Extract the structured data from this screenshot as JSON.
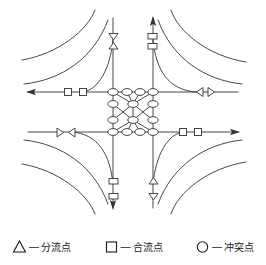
{
  "figure": {
    "type": "traffic-interchange-conflict-point-diagram"
  },
  "legend": {
    "items": [
      {
        "symbol": "triangle",
        "icon_name": "triangle-icon",
        "dash": "—",
        "label": "分流点"
      },
      {
        "symbol": "square",
        "icon_name": "square-icon",
        "dash": "—",
        "label": "合流点"
      },
      {
        "symbol": "circle",
        "icon_name": "circle-icon",
        "dash": "—",
        "label": "冲突点"
      }
    ]
  },
  "colors": {
    "stroke": "#333333",
    "fill": "#ffffff",
    "text": "#1a1a1a",
    "background": "#ffffff"
  },
  "geometry": {
    "center_x": 133,
    "center_y": 112,
    "road_north_left_x": 113,
    "road_north_right_x": 153,
    "road_west_top_y": 92,
    "road_east_bottom_y": 132
  },
  "arrows": {
    "north_up": "up",
    "south_down": "down",
    "west_left": "left",
    "east_right": "right"
  },
  "conflict_points": [
    {
      "x": 113,
      "y": 92
    },
    {
      "x": 127,
      "y": 92
    },
    {
      "x": 140,
      "y": 92
    },
    {
      "x": 153,
      "y": 92
    },
    {
      "x": 133,
      "y": 104
    },
    {
      "x": 113,
      "y": 104
    },
    {
      "x": 153,
      "y": 104
    },
    {
      "x": 113,
      "y": 120
    },
    {
      "x": 153,
      "y": 120
    },
    {
      "x": 133,
      "y": 120
    },
    {
      "x": 113,
      "y": 132
    },
    {
      "x": 127,
      "y": 132
    },
    {
      "x": 140,
      "y": 132
    },
    {
      "x": 153,
      "y": 132
    }
  ],
  "merge_points": [
    {
      "x": 68,
      "y": 92
    },
    {
      "x": 83,
      "y": 92
    },
    {
      "x": 183,
      "y": 132
    },
    {
      "x": 198,
      "y": 132
    },
    {
      "x": 150,
      "y": 38
    },
    {
      "x": 150,
      "y": 48
    },
    {
      "x": 114,
      "y": 182
    },
    {
      "x": 114,
      "y": 198
    }
  ],
  "diverge_points": [
    {
      "x": 114,
      "y": 38
    },
    {
      "x": 114,
      "y": 47
    },
    {
      "x": 150,
      "y": 182
    },
    {
      "x": 150,
      "y": 198
    },
    {
      "x": 60,
      "y": 145
    },
    {
      "x": 72,
      "y": 145
    },
    {
      "x": 196,
      "y": 92
    },
    {
      "x": 208,
      "y": 92
    }
  ]
}
